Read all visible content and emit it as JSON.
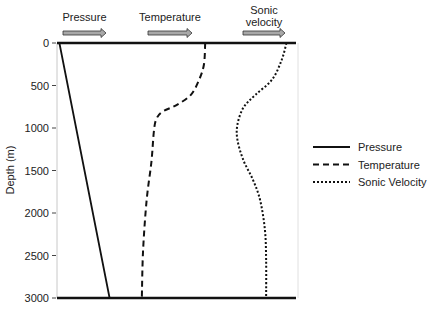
{
  "chart_data": {
    "type": "line",
    "title": "",
    "xlabel": "",
    "ylabel": "Depth (m)",
    "ylim": [
      0,
      3000
    ],
    "y_inverted": true,
    "yticks": [
      0,
      500,
      1000,
      1500,
      2000,
      2500,
      3000
    ],
    "ytick_labels": [
      "0",
      "500",
      "1000",
      "1500",
      "2000",
      "2500",
      "3000"
    ],
    "x_units": "relative (0-1, increasing to the right)",
    "grid": false,
    "legend": {
      "position": "right",
      "entries": [
        {
          "label": "Pressure",
          "style": "solid"
        },
        {
          "label": "Temperature",
          "style": "dashed"
        },
        {
          "label": "Sonic Velocity",
          "style": "dotted"
        }
      ]
    },
    "top_annotations": [
      {
        "label": "Pressure",
        "arrow": "right"
      },
      {
        "label": "Temperature",
        "arrow": "right"
      },
      {
        "label": "Sonic\nvelocity",
        "arrow": "right"
      }
    ],
    "series": [
      {
        "name": "Pressure",
        "style": "solid",
        "points": [
          [
            0.01,
            0
          ],
          [
            0.22,
            3000
          ]
        ]
      },
      {
        "name": "Temperature",
        "style": "dashed",
        "points": [
          [
            0.62,
            0
          ],
          [
            0.615,
            250
          ],
          [
            0.595,
            430
          ],
          [
            0.56,
            610
          ],
          [
            0.5,
            730
          ],
          [
            0.44,
            810
          ],
          [
            0.415,
            900
          ],
          [
            0.405,
            1050
          ],
          [
            0.395,
            1400
          ],
          [
            0.375,
            1850
          ],
          [
            0.36,
            2450
          ],
          [
            0.355,
            3000
          ]
        ]
      },
      {
        "name": "Sonic Velocity",
        "style": "dotted",
        "points": [
          [
            0.96,
            0
          ],
          [
            0.94,
            200
          ],
          [
            0.9,
            430
          ],
          [
            0.83,
            610
          ],
          [
            0.78,
            760
          ],
          [
            0.755,
            960
          ],
          [
            0.755,
            1140
          ],
          [
            0.78,
            1380
          ],
          [
            0.82,
            1610
          ],
          [
            0.85,
            1850
          ],
          [
            0.87,
            2200
          ],
          [
            0.875,
            2550
          ],
          [
            0.875,
            3000
          ]
        ]
      }
    ]
  }
}
